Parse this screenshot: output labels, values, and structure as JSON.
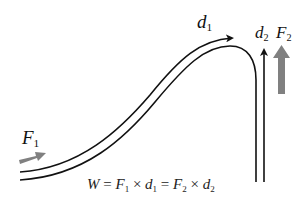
{
  "diagram": {
    "labels": {
      "F1": {
        "symbol": "F",
        "subscript": "1"
      },
      "d1": {
        "symbol": "d",
        "subscript": "1"
      },
      "d2": {
        "symbol": "d",
        "subscript": "2"
      },
      "F2": {
        "symbol": "F",
        "subscript": "2"
      }
    },
    "equation": {
      "W": "W",
      "eq1": " = ",
      "F1": "F",
      "F1_sub": "1",
      "times1": " × ",
      "d1": "d",
      "d1_sub": "1",
      "eq2": " = ",
      "F2": "F",
      "F2_sub": "2",
      "times2": " × ",
      "d2": "d",
      "d2_sub": "2"
    },
    "colors": {
      "track": "#111111",
      "force_arrow": "#808080",
      "distance_arrow": "#111111"
    }
  }
}
